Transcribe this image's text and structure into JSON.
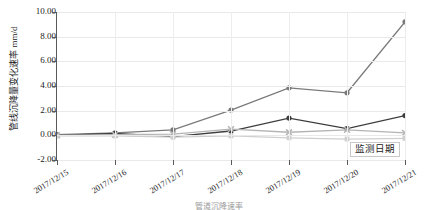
{
  "chart_data": {
    "type": "line",
    "title": "",
    "xlabel": "监测日期",
    "ylabel": "管线沉降量变化速率 mm/d",
    "categories": [
      "2017/12/15",
      "2017/12/16",
      "2017/12/17",
      "2017/12/18",
      "2017/12/19",
      "2017/12/20",
      "2017/12/21"
    ],
    "ylim": [
      -2.0,
      10.0
    ],
    "ytick_labels": [
      "10.00",
      "8.00",
      "6.00",
      "4.00",
      "2.00",
      "0.00",
      "-2.00"
    ],
    "ytick_values": [
      10.0,
      8.0,
      6.0,
      4.0,
      2.0,
      0.0,
      -2.0
    ],
    "grid": true,
    "legend": "none",
    "series": [
      {
        "name": "series-1",
        "color": "#7a7a7a",
        "marker": "circle",
        "values": [
          0.05,
          0.2,
          0.45,
          2.05,
          3.85,
          3.45,
          9.2
        ]
      },
      {
        "name": "series-2",
        "color": "#3d3d3d",
        "marker": "circle",
        "values": [
          0.0,
          0.15,
          -0.1,
          0.35,
          1.4,
          0.55,
          1.6
        ]
      },
      {
        "name": "series-3",
        "color": "#b4b4b4",
        "marker": "x",
        "values": [
          0.0,
          0.05,
          0.1,
          0.5,
          0.25,
          0.45,
          0.2
        ]
      },
      {
        "name": "series-4",
        "color": "#cfcfcf",
        "marker": "square",
        "values": [
          -0.05,
          -0.05,
          -0.15,
          -0.05,
          -0.2,
          -0.3,
          -0.25
        ]
      }
    ]
  },
  "axis": {
    "y_title": "管线沉降量变化速率 mm/d",
    "x_title": "监测日期"
  },
  "caption": "管道沉降速率"
}
